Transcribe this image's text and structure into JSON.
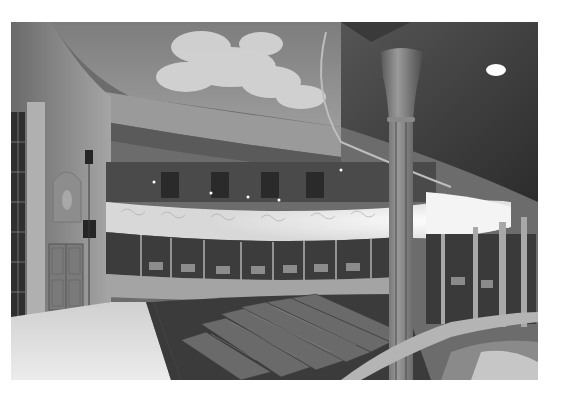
{
  "image": {
    "subject": "Theatre auditorium interior with painted sky ceiling, curved illuminated balcony, columns and tiered seating",
    "alt": "Interior of a historic theatre seen from a box, with a cast-iron column in the foreground, curved lit dress circle, painted cloud ceiling, stage floor at left and raked seating in the pit",
    "tone": "monochrome",
    "colors": {
      "background": "#ffffff",
      "ceiling_sky": "#8a8a8a",
      "cloud": "#d6d6d6",
      "wall": "#9a9a9a",
      "shadow": "#2e2e2e",
      "balcony_light": "#f2f2f2",
      "stage_floor": "#e4e4e4",
      "seats": "#5a5a5a",
      "column": "#6e6e6e"
    },
    "frame": {
      "left": 11,
      "top": 22,
      "width": 527,
      "height": 358
    }
  }
}
